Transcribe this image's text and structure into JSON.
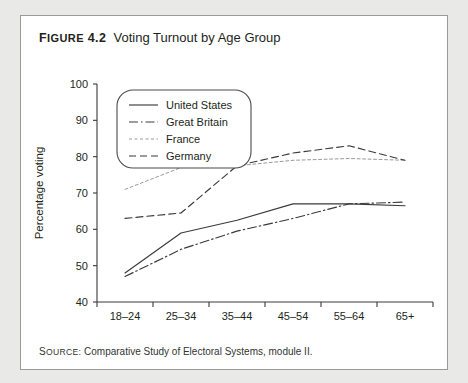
{
  "figure": {
    "number_label": "FIGURE 4.2",
    "number_prefix": "F",
    "number_caps": "IGURE",
    "number_value": " 4.2",
    "title": "Voting Turnout by Age Group",
    "source_label": "SOURCE:",
    "source_prefix": "S",
    "source_caps": "OURCE",
    "source_text": "Comparative Study of Electoral Systems, module II."
  },
  "chart_data": {
    "type": "line",
    "title": "Voting Turnout by Age Group",
    "xlabel": "Age group",
    "ylabel": "Percentage voting",
    "categories": [
      "18–24",
      "25–34",
      "35–44",
      "45–54",
      "55–64",
      "65+"
    ],
    "ylim": [
      40,
      100
    ],
    "yticks": [
      40,
      50,
      60,
      70,
      80,
      90,
      100
    ],
    "grid": false,
    "legend_position": "upper-left-inside",
    "series": [
      {
        "name": "United States",
        "style": "solid",
        "color": "#3a3a3a",
        "values": [
          48.0,
          59.0,
          62.5,
          67.0,
          67.0,
          66.5
        ]
      },
      {
        "name": "Great Britain",
        "style": "dash-dot",
        "color": "#3a3a3a",
        "values": [
          47.0,
          54.5,
          59.5,
          63.0,
          67.0,
          67.5
        ]
      },
      {
        "name": "France",
        "style": "faint-dotted",
        "color": "#9a9a9a",
        "values": [
          71.0,
          77.0,
          77.5,
          79.0,
          79.5,
          79.0
        ]
      },
      {
        "name": "Germany",
        "style": "dashed",
        "color": "#3a3a3a",
        "values": [
          63.0,
          64.5,
          77.5,
          81.0,
          83.0,
          79.0
        ]
      }
    ]
  }
}
